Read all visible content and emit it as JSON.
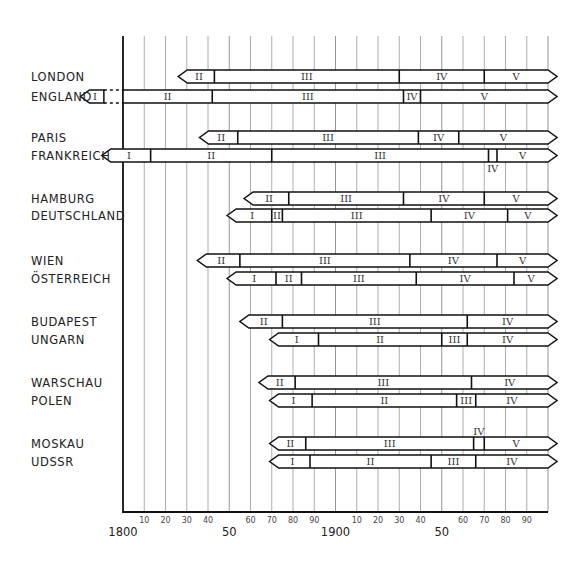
{
  "chart_data": {
    "type": "gantt-timeline",
    "title": "",
    "xlabel": "",
    "ylabel": "",
    "xlim": [
      1800,
      2000
    ],
    "grid": true,
    "x_ticks_major": [
      {
        "year": 1800,
        "label": "1800"
      },
      {
        "year": 1850,
        "label": "50"
      },
      {
        "year": 1900,
        "label": "1900"
      },
      {
        "year": 1950,
        "label": "50"
      }
    ],
    "x_ticks_minor": [
      {
        "year": 1810,
        "label": "10"
      },
      {
        "year": 1820,
        "label": "20"
      },
      {
        "year": 1830,
        "label": "30"
      },
      {
        "year": 1840,
        "label": "40"
      },
      {
        "year": 1860,
        "label": "60"
      },
      {
        "year": 1870,
        "label": "70"
      },
      {
        "year": 1880,
        "label": "80"
      },
      {
        "year": 1890,
        "label": "90"
      },
      {
        "year": 1910,
        "label": "10"
      },
      {
        "year": 1920,
        "label": "20"
      },
      {
        "year": 1930,
        "label": "30"
      },
      {
        "year": 1940,
        "label": "40"
      },
      {
        "year": 1960,
        "label": "60"
      },
      {
        "year": 1970,
        "label": "70"
      },
      {
        "year": 1980,
        "label": "80"
      },
      {
        "year": 1990,
        "label": "90"
      }
    ],
    "rows": [
      {
        "label": "LONDON",
        "y": 70,
        "start": 1826,
        "end": 2000,
        "segments": [
          {
            "label": "II",
            "from": 1826,
            "to": 1843
          },
          {
            "label": "III",
            "from": 1843,
            "to": 1930
          },
          {
            "label": "IV",
            "from": 1930,
            "to": 1970
          },
          {
            "label": "V",
            "from": 1970,
            "to": 2000
          }
        ]
      },
      {
        "label": "ENGLAND",
        "y": 90,
        "start": 1780,
        "end": 2000,
        "dashed_gap": [
          1791,
          1800
        ],
        "segments": [
          {
            "label": "I",
            "from": 1780,
            "to": 1791
          },
          {
            "label": "II",
            "from": 1800,
            "to": 1842
          },
          {
            "label": "III",
            "from": 1842,
            "to": 1932
          },
          {
            "label": "IV",
            "from": 1932,
            "to": 1940
          },
          {
            "label": "V",
            "from": 1940,
            "to": 2000
          }
        ]
      },
      {
        "label": "PARIS",
        "y": 131,
        "start": 1836,
        "end": 2000,
        "segments": [
          {
            "label": "II",
            "from": 1836,
            "to": 1854
          },
          {
            "label": "III",
            "from": 1854,
            "to": 1939
          },
          {
            "label": "IV",
            "from": 1939,
            "to": 1958
          },
          {
            "label": "V",
            "from": 1958,
            "to": 2000
          }
        ]
      },
      {
        "label": "FRANKREICH",
        "y": 149,
        "start": 1790,
        "end": 2000,
        "segments": [
          {
            "label": "I",
            "from": 1790,
            "to": 1813
          },
          {
            "label": "II",
            "from": 1813,
            "to": 1870
          },
          {
            "label": "III",
            "from": 1870,
            "to": 1972
          },
          {
            "label": "IV",
            "from": 1972,
            "to": 1976,
            "label_below": true
          },
          {
            "label": "V",
            "from": 1976,
            "to": 2000
          }
        ]
      },
      {
        "label": "HAMBURG",
        "y": 192,
        "start": 1857,
        "end": 2000,
        "segments": [
          {
            "label": "II",
            "from": 1857,
            "to": 1878
          },
          {
            "label": "III",
            "from": 1878,
            "to": 1932
          },
          {
            "label": "IV",
            "from": 1932,
            "to": 1970
          },
          {
            "label": "V",
            "from": 1970,
            "to": 2000
          }
        ]
      },
      {
        "label": "DEUTSCHLAND",
        "y": 209,
        "start": 1849,
        "end": 2000,
        "segments": [
          {
            "label": "I",
            "from": 1849,
            "to": 1870
          },
          {
            "label": "II",
            "from": 1870,
            "to": 1875
          },
          {
            "label": "III",
            "from": 1875,
            "to": 1945
          },
          {
            "label": "IV",
            "from": 1945,
            "to": 1981
          },
          {
            "label": "V",
            "from": 1981,
            "to": 2000
          }
        ]
      },
      {
        "label": "WIEN",
        "y": 254,
        "start": 1835,
        "end": 2000,
        "segments": [
          {
            "label": "II",
            "from": 1835,
            "to": 1855
          },
          {
            "label": "III",
            "from": 1855,
            "to": 1935
          },
          {
            "label": "IV",
            "from": 1935,
            "to": 1976
          },
          {
            "label": "V",
            "from": 1976,
            "to": 2000
          }
        ]
      },
      {
        "label": "ÖSTERREICH",
        "y": 272,
        "start": 1849,
        "end": 2000,
        "segments": [
          {
            "label": "I",
            "from": 1849,
            "to": 1872
          },
          {
            "label": "II",
            "from": 1872,
            "to": 1884
          },
          {
            "label": "III",
            "from": 1884,
            "to": 1938
          },
          {
            "label": "IV",
            "from": 1938,
            "to": 1984
          },
          {
            "label": "V",
            "from": 1984,
            "to": 2000
          }
        ]
      },
      {
        "label": "BUDAPEST",
        "y": 315,
        "start": 1855,
        "end": 2000,
        "segments": [
          {
            "label": "II",
            "from": 1855,
            "to": 1875
          },
          {
            "label": "III",
            "from": 1875,
            "to": 1962
          },
          {
            "label": "IV",
            "from": 1962,
            "to": 2000
          }
        ]
      },
      {
        "label": "UNGARN",
        "y": 333,
        "start": 1869,
        "end": 2000,
        "segments": [
          {
            "label": "I",
            "from": 1869,
            "to": 1892
          },
          {
            "label": "II",
            "from": 1892,
            "to": 1950
          },
          {
            "label": "III",
            "from": 1950,
            "to": 1962
          },
          {
            "label": "IV",
            "from": 1962,
            "to": 2000
          }
        ]
      },
      {
        "label": "WARSCHAU",
        "y": 376,
        "start": 1864,
        "end": 2000,
        "segments": [
          {
            "label": "II",
            "from": 1864,
            "to": 1881
          },
          {
            "label": "III",
            "from": 1881,
            "to": 1964
          },
          {
            "label": "IV",
            "from": 1964,
            "to": 2000
          }
        ]
      },
      {
        "label": "POLEN",
        "y": 394,
        "start": 1869,
        "end": 2000,
        "segments": [
          {
            "label": "I",
            "from": 1869,
            "to": 1889
          },
          {
            "label": "II",
            "from": 1889,
            "to": 1957
          },
          {
            "label": "III",
            "from": 1957,
            "to": 1966
          },
          {
            "label": "IV",
            "from": 1966,
            "to": 2000
          }
        ]
      },
      {
        "label": "MOSKAU",
        "y": 437,
        "start": 1869,
        "end": 2000,
        "segments": [
          {
            "label": "II",
            "from": 1869,
            "to": 1886
          },
          {
            "label": "III",
            "from": 1886,
            "to": 1965
          },
          {
            "label": "IV",
            "from": 1965,
            "to": 1970,
            "label_above": true
          },
          {
            "label": "V",
            "from": 1970,
            "to": 2000
          }
        ]
      },
      {
        "label": "UDSSR",
        "y": 455,
        "start": 1869,
        "end": 2000,
        "segments": [
          {
            "label": "I",
            "from": 1869,
            "to": 1888
          },
          {
            "label": "II",
            "from": 1888,
            "to": 1945
          },
          {
            "label": "III",
            "from": 1945,
            "to": 1966
          },
          {
            "label": "IV",
            "from": 1966,
            "to": 2000
          }
        ]
      }
    ]
  }
}
